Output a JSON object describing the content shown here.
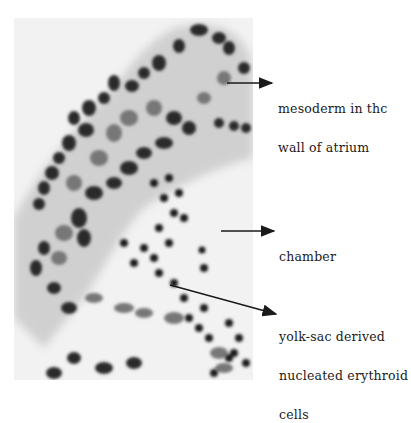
{
  "figure": {
    "labels": [
      {
        "id": "mesoderm",
        "lines": [
          "mesoderm in thc",
          "wall of atrium"
        ]
      },
      {
        "id": "chamber",
        "lines": [
          "chamber"
        ]
      },
      {
        "id": "erythroid",
        "lines": [
          "yolk-sac derived",
          "nucleated erythroid",
          "cells"
        ]
      }
    ]
  }
}
